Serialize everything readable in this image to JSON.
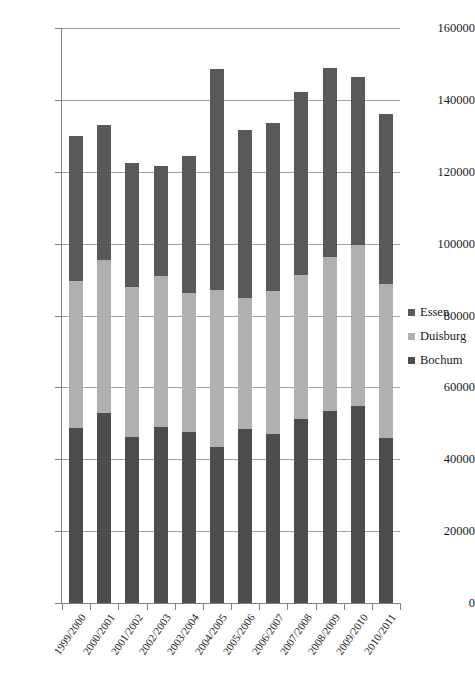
{
  "chart_data": {
    "type": "bar",
    "subtype": "stacked-vertical",
    "title": "",
    "xlabel": "",
    "ylabel": "",
    "ylim": [
      0,
      160000
    ],
    "ytick_step": 20000,
    "ytick_labels": [
      "0",
      "20000",
      "40000",
      "60000",
      "80000",
      "100000",
      "120000",
      "140000",
      "160000"
    ],
    "ytick_values": [
      0,
      20000,
      40000,
      60000,
      80000,
      100000,
      120000,
      140000,
      160000
    ],
    "grid": true,
    "grid_axis": "y",
    "legend_position": "right",
    "categories": [
      "1999/2000",
      "2000/2001",
      "2001/2002",
      "2002/2003",
      "2003/2004",
      "2004/2005",
      "2005/2006",
      "2006/2007",
      "2007/2008",
      "2008/2009",
      "2009/2010",
      "2010/2011"
    ],
    "series": [
      {
        "name": "Bochum",
        "color": "#4d4d4d",
        "stack_order": 0,
        "values": [
          48600,
          53000,
          46100,
          48900,
          47600,
          43400,
          48300,
          46900,
          51200,
          53400,
          54800,
          45800
        ]
      },
      {
        "name": "Duisburg",
        "color": "#b0b0b0",
        "stack_order": 1,
        "values": [
          41100,
          42400,
          41900,
          42200,
          38800,
          43600,
          36700,
          39800,
          40000,
          43000,
          44700,
          43100
        ]
      },
      {
        "name": "Essen",
        "color": "#595959",
        "stack_order": 2,
        "values": [
          40300,
          37600,
          34500,
          30400,
          38100,
          61700,
          46500,
          46800,
          51100,
          52400,
          47000,
          47100
        ]
      }
    ],
    "totals": [
      130000,
      133000,
      122500,
      121500,
      124500,
      148700,
      131500,
      133500,
      142300,
      148800,
      146500,
      136000
    ]
  },
  "legend": {
    "items": [
      {
        "label": "Essen",
        "color": "#595959"
      },
      {
        "label": "Duisburg",
        "color": "#b0b0b0"
      },
      {
        "label": "Bochum",
        "color": "#4d4d4d"
      }
    ]
  },
  "colors": {
    "gridline": "#a6a6a6",
    "axis": "#808080",
    "background": "#ffffff",
    "text": "#1a1a1a"
  }
}
